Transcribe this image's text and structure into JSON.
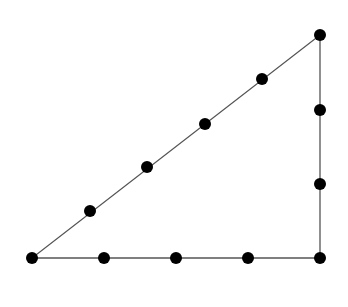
{
  "diagram": {
    "type": "right-triangle-with-dots",
    "line_color": "#555555",
    "dot_color": "#000000",
    "dot_radius": 6,
    "vertices": [
      {
        "x": 32,
        "y": 258
      },
      {
        "x": 320,
        "y": 258
      },
      {
        "x": 320,
        "y": 35
      }
    ],
    "points": [
      {
        "x": 32,
        "y": 258
      },
      {
        "x": 104,
        "y": 258
      },
      {
        "x": 176,
        "y": 258
      },
      {
        "x": 248,
        "y": 258
      },
      {
        "x": 320,
        "y": 258
      },
      {
        "x": 320,
        "y": 184
      },
      {
        "x": 320,
        "y": 110
      },
      {
        "x": 320,
        "y": 35
      },
      {
        "x": 262,
        "y": 79
      },
      {
        "x": 205,
        "y": 124
      },
      {
        "x": 147,
        "y": 167
      },
      {
        "x": 90,
        "y": 211
      }
    ],
    "counts": {
      "bottom_side": 5,
      "vertical_side": 4,
      "hypotenuse": 6,
      "total": 12
    }
  }
}
